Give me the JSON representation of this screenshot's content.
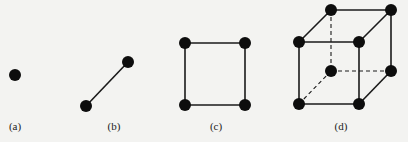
{
  "figure": {
    "background": "#f3f3f1",
    "node_color": "#0d0d0d",
    "edge_color": "#1a1a1a",
    "node_radius": 6,
    "panels": [
      {
        "id": "a",
        "label": "(a)",
        "label_x": 15,
        "description": "single vertex (0-dimensional hypercube)",
        "nodes": [
          [
            15,
            75
          ]
        ],
        "edges": [],
        "dashed_edges": []
      },
      {
        "id": "b",
        "label": "(b)",
        "label_x": 114,
        "description": "two vertices joined by an edge (1-dimensional hypercube)",
        "nodes": [
          [
            86,
            106
          ],
          [
            128,
            62
          ]
        ],
        "edges": [
          [
            0,
            1
          ]
        ],
        "dashed_edges": []
      },
      {
        "id": "c",
        "label": "(c)",
        "label_x": 216,
        "description": "square (2-dimensional hypercube)",
        "nodes": [
          [
            185,
            43
          ],
          [
            245,
            43
          ],
          [
            185,
            105
          ],
          [
            245,
            105
          ]
        ],
        "edges": [
          [
            0,
            1
          ],
          [
            1,
            3
          ],
          [
            3,
            2
          ],
          [
            2,
            0
          ]
        ],
        "dashed_edges": []
      },
      {
        "id": "d",
        "label": "(d)",
        "label_x": 341,
        "description": "cube (3-dimensional hypercube) with hidden edges dashed",
        "nodes": [
          [
            331,
            10
          ],
          [
            391,
            10
          ],
          [
            299,
            42
          ],
          [
            359,
            42
          ],
          [
            331,
            71
          ],
          [
            391,
            71
          ],
          [
            299,
            104
          ],
          [
            359,
            104
          ]
        ],
        "edges": [
          [
            0,
            1
          ],
          [
            2,
            3
          ],
          [
            0,
            2
          ],
          [
            1,
            3
          ],
          [
            2,
            6
          ],
          [
            3,
            7
          ],
          [
            6,
            7
          ],
          [
            1,
            5
          ],
          [
            5,
            7
          ]
        ],
        "dashed_edges": [
          [
            0,
            4
          ],
          [
            4,
            5
          ],
          [
            4,
            6
          ]
        ]
      }
    ]
  }
}
